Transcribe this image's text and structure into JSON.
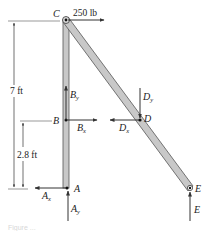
{
  "diagram": {
    "type": "free-body diagram of a two-member frame",
    "points": {
      "A": "A",
      "B": "B",
      "C": "C",
      "D": "D",
      "E": "E"
    },
    "applied_load": {
      "label": "250 lb",
      "at": "C",
      "direction": "right"
    },
    "reactions": {
      "Ax": {
        "base": "A",
        "sub": "x"
      },
      "Ay": {
        "base": "A",
        "sub": "y"
      },
      "Bx": {
        "base": "B",
        "sub": "x"
      },
      "By": {
        "base": "B",
        "sub": "y"
      },
      "Dx": {
        "base": "D",
        "sub": "x"
      },
      "Dy": {
        "base": "D",
        "sub": "y"
      },
      "E": {
        "base": "E"
      }
    },
    "dimensions": {
      "total_height": "7 ft",
      "B_height": "2.8 ft"
    },
    "colors": {
      "member_fill": "#c8c8c8",
      "member_stroke": "#555555",
      "arrow": "#333333"
    }
  },
  "caption": {
    "text": "Figure ..."
  }
}
